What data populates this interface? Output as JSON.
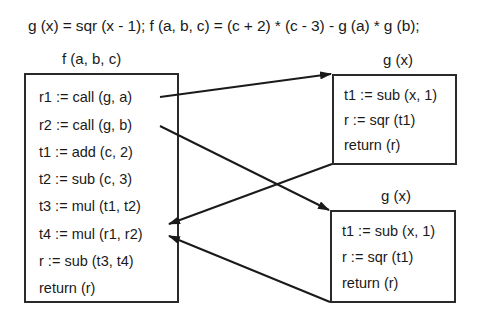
{
  "header": {
    "equation": "g (x) = sqr (x - 1);   f (a, b, c) = (c + 2) * (c - 3) - g (a) * g (b);"
  },
  "procedures": {
    "f": {
      "title": "f (a, b, c)",
      "lines": [
        "r1 := call (g, a)",
        "r2 := call (g, b)",
        "t1 := add (c, 2)",
        "t2 := sub (c, 3)",
        "t3 := mul (t1, t2)",
        "t4 := mul (r1, r2)",
        "r := sub (t3, t4)",
        "return (r)"
      ]
    },
    "g_top": {
      "title": "g (x)",
      "lines": [
        "t1 := sub (x, 1)",
        "r := sqr (t1)",
        "return (r)"
      ]
    },
    "g_bottom": {
      "title": "g (x)",
      "lines": [
        "t1 := sub (x, 1)",
        "r := sqr (t1)",
        "return (r)"
      ]
    }
  },
  "edges": [
    {
      "from": "f: r1 := call (g, a)",
      "to": "g_top",
      "kind": "call"
    },
    {
      "from": "f: r2 := call (g, b)",
      "to": "g_bottom",
      "kind": "call"
    },
    {
      "from": "g_top",
      "to": "f: t4 := mul (r1, r2)",
      "kind": "return"
    },
    {
      "from": "g_bottom",
      "to": "f: t4 := mul (r1, r2)",
      "kind": "return"
    }
  ]
}
